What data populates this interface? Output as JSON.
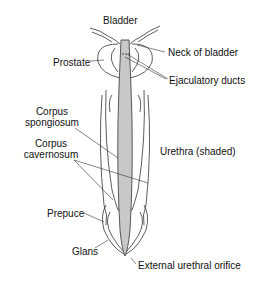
{
  "diagram": {
    "type": "anatomical illustration",
    "labels": {
      "bladder": "Bladder",
      "neck_of_bladder": "Neck of bladder",
      "prostate": "Prostate",
      "ejaculatory_ducts": "Ejaculatory ducts",
      "corpus_spongiosum_1": "Corpus",
      "corpus_spongiosum_2": "spongiosum",
      "corpus_cavernosum_1": "Corpus",
      "corpus_cavernosum_2": "cavernosum",
      "urethra": "Urethra (shaded)",
      "prepuce": "Prepuce",
      "glans": "Glans",
      "external_urethral_orifice": "External urethral orifice"
    },
    "colors": {
      "line": "#333333",
      "urethra_shade": "#c8c8c8",
      "background": "#ffffff"
    }
  }
}
